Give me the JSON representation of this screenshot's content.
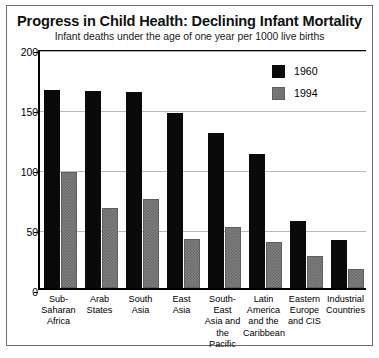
{
  "chart_data": {
    "type": "bar",
    "title": "Progress in Child Health: Declining Infant Mortality",
    "subtitle": "Infant deaths under the age of one year per 1000 live births",
    "xlabel": "",
    "ylabel": "",
    "ylim": [
      0,
      200
    ],
    "yticks": [
      0,
      50,
      100,
      150,
      200
    ],
    "ytick_labels": [
      "0",
      "50",
      "100",
      "150",
      "200"
    ],
    "grid": true,
    "legend_position": "top-right",
    "categories": [
      "Sub-Saharan Africa",
      "Arab States",
      "South Asia",
      "East Asia",
      "South-East Asia and the Pacific",
      "Latin America and the Caribbean",
      "Eastern Europe and CIS",
      "Industrial Countries"
    ],
    "category_lines": [
      [
        "Sub-",
        "Saharan",
        "Africa"
      ],
      [
        "Arab",
        "States"
      ],
      [
        "South",
        "Asia"
      ],
      [
        "East",
        "Asia"
      ],
      [
        "South-East",
        "Asia and",
        "the Pacific"
      ],
      [
        "Latin",
        "America",
        "and the",
        "Caribbean"
      ],
      [
        "Eastern",
        "Europe",
        "and CIS"
      ],
      [
        "Industrial",
        "Countries"
      ]
    ],
    "series": [
      {
        "name": "1960",
        "color": "#0a0a0a",
        "values": [
          165,
          164,
          163,
          146,
          129,
          112,
          56,
          40
        ]
      },
      {
        "name": "1994",
        "color": "#808080",
        "values": [
          97,
          67,
          74,
          41,
          51,
          38,
          27,
          16
        ]
      }
    ]
  },
  "legend": {
    "entries": [
      {
        "label": "1960"
      },
      {
        "label": "1994"
      }
    ]
  },
  "colors": {
    "series_1960": "#0a0a0a",
    "series_1994": "#808080",
    "axis": "#000000",
    "grid": "#b9b9b9",
    "frame": "#6e6e6e",
    "background": "#ffffff"
  }
}
